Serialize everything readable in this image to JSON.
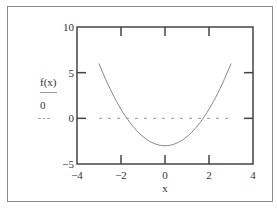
{
  "chart_data": {
    "type": "line",
    "title": "",
    "xlabel": "x",
    "ylabel": "f(x)",
    "xlim": [
      -4,
      4
    ],
    "ylim": [
      -5,
      10
    ],
    "x_ticks": [
      "-4",
      "-2",
      "0",
      "2",
      "4"
    ],
    "y_ticks": [
      "10",
      "5",
      "0",
      "-5"
    ],
    "grid": false,
    "legend": "none",
    "series": [
      {
        "name": "f(x)",
        "style": "solid",
        "color": "#888888",
        "x": [
          -3,
          -2.5,
          -2,
          -1.5,
          -1,
          -0.5,
          0,
          0.5,
          1,
          1.5,
          2,
          2.5,
          3
        ],
        "values": [
          6,
          3.25,
          1,
          -0.75,
          -2,
          -2.75,
          -3,
          -2.75,
          -2,
          -0.75,
          1,
          3.25,
          6
        ]
      },
      {
        "name": "0",
        "style": "dashed",
        "color": "#999999",
        "x": [
          -3,
          3
        ],
        "values": [
          0,
          0
        ]
      }
    ]
  },
  "labels": {
    "ylabel": "f(x)",
    "ylabel2": "0",
    "xlabel": "x"
  }
}
